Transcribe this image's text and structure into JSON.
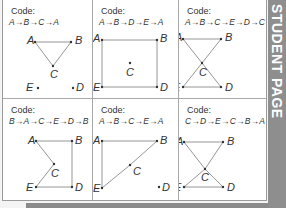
{
  "banner": {
    "text": "STUDENT PAGE"
  },
  "code_label": "Code:",
  "cells": [
    {
      "code": "A→B→C→A"
    },
    {
      "code": "A→B→D→E→A"
    },
    {
      "code": "A→B→C→E→D→C→A"
    },
    {
      "code": "B→A→C→E→D→B"
    },
    {
      "code": "A→B→C→E→A"
    },
    {
      "code": "C→D→E→C→B→A→C"
    }
  ],
  "points": {
    "A": "A",
    "B": "B",
    "C": "C",
    "D": "D",
    "E": "E"
  },
  "colors": {
    "banner": "#8e8e8e",
    "line": "#8a8a8a",
    "border": "#9a9a9a"
  }
}
